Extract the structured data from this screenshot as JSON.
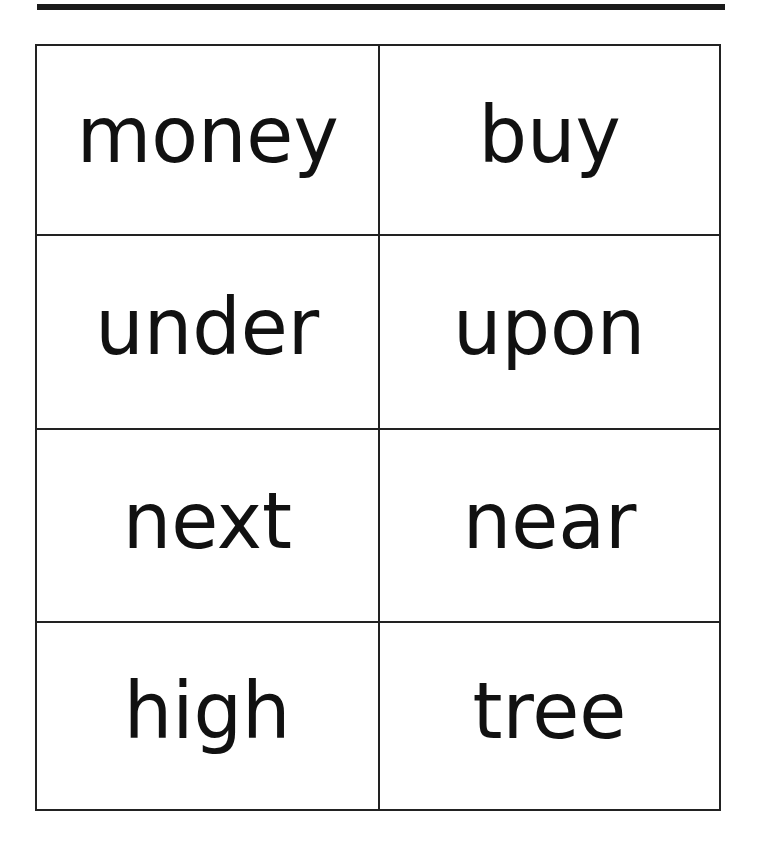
{
  "page": {
    "type": "word-flashcards",
    "colors": {
      "background": "#ffffff",
      "border": "#222222",
      "text": "#111111"
    }
  },
  "cards": [
    {
      "word": "money",
      "row": 1,
      "col": 1
    },
    {
      "word": "buy",
      "row": 1,
      "col": 2
    },
    {
      "word": "under",
      "row": 2,
      "col": 1
    },
    {
      "word": "upon",
      "row": 2,
      "col": 2
    },
    {
      "word": "next",
      "row": 3,
      "col": 1
    },
    {
      "word": "near",
      "row": 3,
      "col": 2
    },
    {
      "word": "high",
      "row": 4,
      "col": 1
    },
    {
      "word": "tree",
      "row": 4,
      "col": 2
    }
  ]
}
